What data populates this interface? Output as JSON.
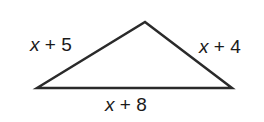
{
  "diagram": {
    "shape": "triangle",
    "vertices": {
      "left": [
        37,
        88
      ],
      "top": [
        145,
        22
      ],
      "right": [
        232,
        88
      ]
    },
    "stroke_color": "#2a2a2a",
    "labels": {
      "left_side": {
        "variable": "x",
        "rest": " + 5"
      },
      "right_side": {
        "variable": "x",
        "rest": " + 4"
      },
      "base": {
        "variable": "x",
        "rest": " + 8"
      }
    }
  }
}
